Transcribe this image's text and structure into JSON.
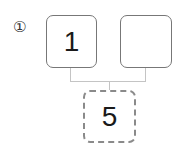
{
  "problem": {
    "number_label": "①"
  },
  "diagram": {
    "top_left_box": {
      "value": "1"
    },
    "top_right_box": {
      "value": ""
    },
    "bottom_box": {
      "value": "5"
    }
  },
  "colors": {
    "box_border": "#777777",
    "result_border": "#8a8a8a",
    "connector": "#c4c4c4"
  }
}
